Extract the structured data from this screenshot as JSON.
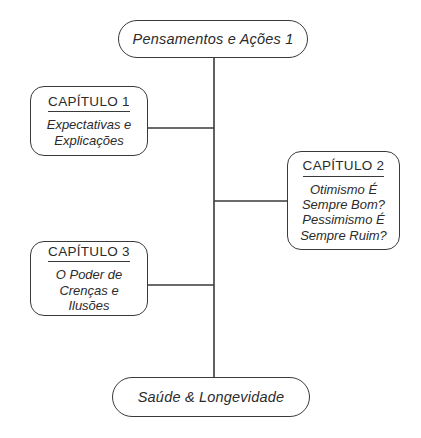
{
  "diagram": {
    "type": "flowchart",
    "orientation": "vertical-trunk-with-branches",
    "background_color": "#ffffff",
    "line_color": "#3a3a3a",
    "text_color": "#2b2b2b",
    "nodes": {
      "top": {
        "label": "Pensamentos e Ações 1",
        "shape": "rounded-pill"
      },
      "bottom": {
        "label": "Saúde & Longevidade",
        "shape": "rounded-pill"
      },
      "chapter_1": {
        "heading": "CAPÍTULO 1",
        "shape": "rounded-rectangle",
        "lines": [
          "Expectativas e",
          "Explicações"
        ]
      },
      "chapter_2": {
        "heading": "CAPÍTULO 2",
        "shape": "rounded-rectangle",
        "lines": [
          "Otimismo É",
          "Sempre Bom?",
          "Pessimismo É",
          "Sempre Ruim?"
        ]
      },
      "chapter_3": {
        "heading": "CAPÍTULO 3",
        "shape": "rounded-rectangle",
        "lines": [
          "O Poder de",
          "Crenças e",
          "Ilusões"
        ]
      }
    }
  }
}
